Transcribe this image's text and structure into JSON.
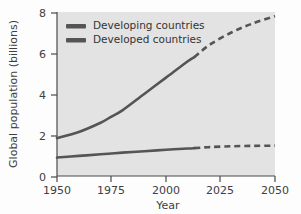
{
  "chart_data": {
    "type": "line",
    "title": "",
    "xlabel": "Year",
    "ylabel": "Global population (billions)",
    "xlim": [
      1950,
      2050
    ],
    "ylim": [
      0,
      8
    ],
    "xticks": [
      1950,
      1975,
      2000,
      2025,
      2050
    ],
    "yticks": [
      0,
      2,
      4,
      6,
      8
    ],
    "grid": false,
    "legend_position": "top-left",
    "projection_start_year": 2013,
    "plot_background_color": "#e3e3e3",
    "series": [
      {
        "name": "Developing countries",
        "color": "#555555",
        "x": [
          1950,
          1960,
          1970,
          1975,
          1980,
          1990,
          2000,
          2010,
          2013,
          2020,
          2030,
          2040,
          2050
        ],
        "values": [
          1.85,
          2.15,
          2.6,
          2.9,
          3.2,
          4.0,
          4.8,
          5.6,
          5.8,
          6.4,
          7.0,
          7.45,
          7.8
        ],
        "solid_until": 2013,
        "style_after": "dashed"
      },
      {
        "name": "Developed countries",
        "color": "#555555",
        "x": [
          1950,
          1960,
          1970,
          1975,
          1980,
          1990,
          2000,
          2010,
          2013,
          2020,
          2030,
          2040,
          2050
        ],
        "values": [
          0.9,
          0.98,
          1.06,
          1.1,
          1.14,
          1.21,
          1.28,
          1.34,
          1.36,
          1.41,
          1.45,
          1.47,
          1.48
        ],
        "solid_until": 2013,
        "style_after": "dashed"
      }
    ]
  },
  "axes": {
    "y_title": "Global population (billions)",
    "x_title": "Year",
    "y_tick_labels": [
      "0",
      "2",
      "4",
      "6",
      "8"
    ],
    "x_tick_labels": [
      "1950",
      "1975",
      "2000",
      "2025",
      "2050"
    ]
  },
  "legend": {
    "entries": [
      {
        "label": "Developing countries",
        "swatch_color": "#555555"
      },
      {
        "label": "Developed countries",
        "swatch_color": "#555555"
      }
    ]
  }
}
